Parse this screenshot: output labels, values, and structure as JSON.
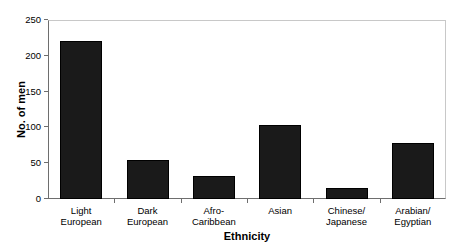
{
  "chart_data": {
    "type": "bar",
    "title": "",
    "xlabel": "Ethnicity",
    "ylabel": "No. of men",
    "categories": [
      "Light European",
      "Dark European",
      "Afro-Caribbean",
      "Asian",
      "Chinese/Japanese",
      "Arabian/Egyptian"
    ],
    "category_lines": [
      [
        "Light",
        "European"
      ],
      [
        "Dark",
        "European"
      ],
      [
        "Afro-",
        "Caribbean"
      ],
      [
        "Asian",
        ""
      ],
      [
        "Chinese/",
        "Japanese"
      ],
      [
        "Arabian/",
        "Egyptian"
      ]
    ],
    "values": [
      220,
      55,
      32,
      103,
      16,
      78
    ],
    "ylim": [
      0,
      250
    ],
    "yticks": [
      0,
      50,
      100,
      150,
      200,
      250
    ],
    "ytick_labels": [
      "0",
      "50",
      "100",
      "150",
      "200",
      "250"
    ],
    "grid": false,
    "legend": "none",
    "bar_color": "#1a1a1a",
    "axis_color": "#6e6e6e",
    "frame_color": "#c8c8c8",
    "background": "#ffffff"
  }
}
